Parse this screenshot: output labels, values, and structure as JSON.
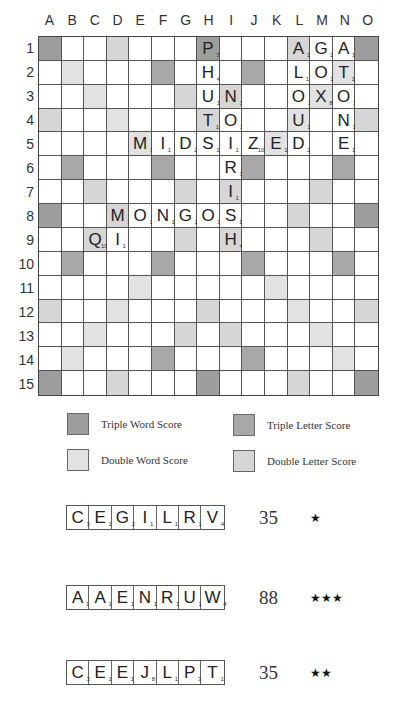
{
  "board": {
    "columns": [
      "A",
      "B",
      "C",
      "D",
      "E",
      "F",
      "G",
      "H",
      "I",
      "J",
      "K",
      "L",
      "M",
      "N",
      "O"
    ],
    "rows": [
      "1",
      "2",
      "3",
      "4",
      "5",
      "6",
      "7",
      "8",
      "9",
      "10",
      "11",
      "12",
      "13",
      "14",
      "15"
    ],
    "premium": {
      "tw": [
        "1A",
        "1H",
        "1O",
        "8A",
        "8O",
        "15A",
        "15H",
        "15O"
      ],
      "tl": [
        "2F",
        "2J",
        "6B",
        "6F",
        "6J",
        "6N",
        "10B",
        "10F",
        "10J",
        "10N",
        "14F",
        "14J"
      ],
      "dw": [
        "2B",
        "3C",
        "4D",
        "5E",
        "2N",
        "3M",
        "4L",
        "5K",
        "11E",
        "12D",
        "13C",
        "14B",
        "11K",
        "12L",
        "13M",
        "14N"
      ],
      "dl": [
        "1D",
        "1L",
        "3G",
        "3I",
        "4A",
        "4H",
        "4O",
        "7C",
        "7G",
        "7I",
        "7M",
        "8D",
        "8L",
        "9C",
        "9G",
        "9I",
        "9M",
        "12A",
        "12H",
        "12O",
        "13G",
        "13I",
        "15D",
        "15L"
      ]
    },
    "tiles": [
      {
        "pos": "1H",
        "letter": "P",
        "value": "3"
      },
      {
        "pos": "2H",
        "letter": "H",
        "value": "4"
      },
      {
        "pos": "3H",
        "letter": "U",
        "value": "1"
      },
      {
        "pos": "4H",
        "letter": "T",
        "value": "1"
      },
      {
        "pos": "5H",
        "letter": "S",
        "value": "1"
      },
      {
        "pos": "3I",
        "letter": "N",
        "value": "1"
      },
      {
        "pos": "4I",
        "letter": "O",
        "value": "1"
      },
      {
        "pos": "5I",
        "letter": "I",
        "value": "1"
      },
      {
        "pos": "6I",
        "letter": "R",
        "value": "1"
      },
      {
        "pos": "7I",
        "letter": "I",
        "value": "1"
      },
      {
        "pos": "8I",
        "letter": "S",
        "value": "1"
      },
      {
        "pos": "9I",
        "letter": "H",
        "value": "4"
      },
      {
        "pos": "5E",
        "letter": "M",
        "value": "3"
      },
      {
        "pos": "5F",
        "letter": "I",
        "value": "1"
      },
      {
        "pos": "5G",
        "letter": "D",
        "value": "2"
      },
      {
        "pos": "5J",
        "letter": "Z",
        "value": "10"
      },
      {
        "pos": "5K",
        "letter": "E",
        "value": "1"
      },
      {
        "pos": "5L",
        "letter": "D",
        "value": "2"
      },
      {
        "pos": "1L",
        "letter": "A",
        "value": "1"
      },
      {
        "pos": "2L",
        "letter": "L",
        "value": "1"
      },
      {
        "pos": "3L",
        "letter": "O",
        "value": "1"
      },
      {
        "pos": "4L",
        "letter": "U",
        "value": "1"
      },
      {
        "pos": "1M",
        "letter": "G",
        "value": "2"
      },
      {
        "pos": "2M",
        "letter": "O",
        "value": "1"
      },
      {
        "pos": "3M",
        "letter": "X",
        "value": "8"
      },
      {
        "pos": "1N",
        "letter": "A",
        "value": "1"
      },
      {
        "pos": "2N",
        "letter": "T",
        "value": "1"
      },
      {
        "pos": "3N",
        "letter": "O",
        "value": "1"
      },
      {
        "pos": "4N",
        "letter": "N",
        "value": "1"
      },
      {
        "pos": "5N",
        "letter": "E",
        "value": "1"
      },
      {
        "pos": "8D",
        "letter": "M",
        "value": "3"
      },
      {
        "pos": "8E",
        "letter": "O",
        "value": "1"
      },
      {
        "pos": "8F",
        "letter": "N",
        "value": "1"
      },
      {
        "pos": "8G",
        "letter": "G",
        "value": "2"
      },
      {
        "pos": "8H",
        "letter": "O",
        "value": "1"
      },
      {
        "pos": "9C",
        "letter": "Q",
        "value": "10"
      },
      {
        "pos": "9D",
        "letter": "I",
        "value": "1"
      }
    ]
  },
  "legend": {
    "triple_word": "Triple Word Score",
    "triple_letter": "Triple Letter Score",
    "double_word": "Double Word Score",
    "double_letter": "Double Letter Score"
  },
  "racks": [
    {
      "tiles": [
        {
          "letter": "C",
          "value": "3"
        },
        {
          "letter": "E",
          "value": "1"
        },
        {
          "letter": "G",
          "value": "2"
        },
        {
          "letter": "I",
          "value": "1"
        },
        {
          "letter": "L",
          "value": "1"
        },
        {
          "letter": "R",
          "value": "1"
        },
        {
          "letter": "V",
          "value": "4"
        }
      ],
      "score": "35",
      "stars": "★"
    },
    {
      "tiles": [
        {
          "letter": "A",
          "value": "1"
        },
        {
          "letter": "A",
          "value": "1"
        },
        {
          "letter": "E",
          "value": "1"
        },
        {
          "letter": "N",
          "value": "1"
        },
        {
          "letter": "R",
          "value": "1"
        },
        {
          "letter": "U",
          "value": "1"
        },
        {
          "letter": "W",
          "value": "4"
        }
      ],
      "score": "88",
      "stars": "★★★"
    },
    {
      "tiles": [
        {
          "letter": "C",
          "value": "3"
        },
        {
          "letter": "E",
          "value": "1"
        },
        {
          "letter": "E",
          "value": "1"
        },
        {
          "letter": "J",
          "value": "8"
        },
        {
          "letter": "L",
          "value": "1"
        },
        {
          "letter": "P",
          "value": "3"
        },
        {
          "letter": "T",
          "value": "1"
        }
      ],
      "score": "35",
      "stars": "★★"
    }
  ],
  "colors": {
    "triple_word": "#9d9d9d",
    "triple_letter": "#a8a8a8",
    "double_word": "#e2e2e2",
    "double_letter": "#d6d6d6"
  }
}
